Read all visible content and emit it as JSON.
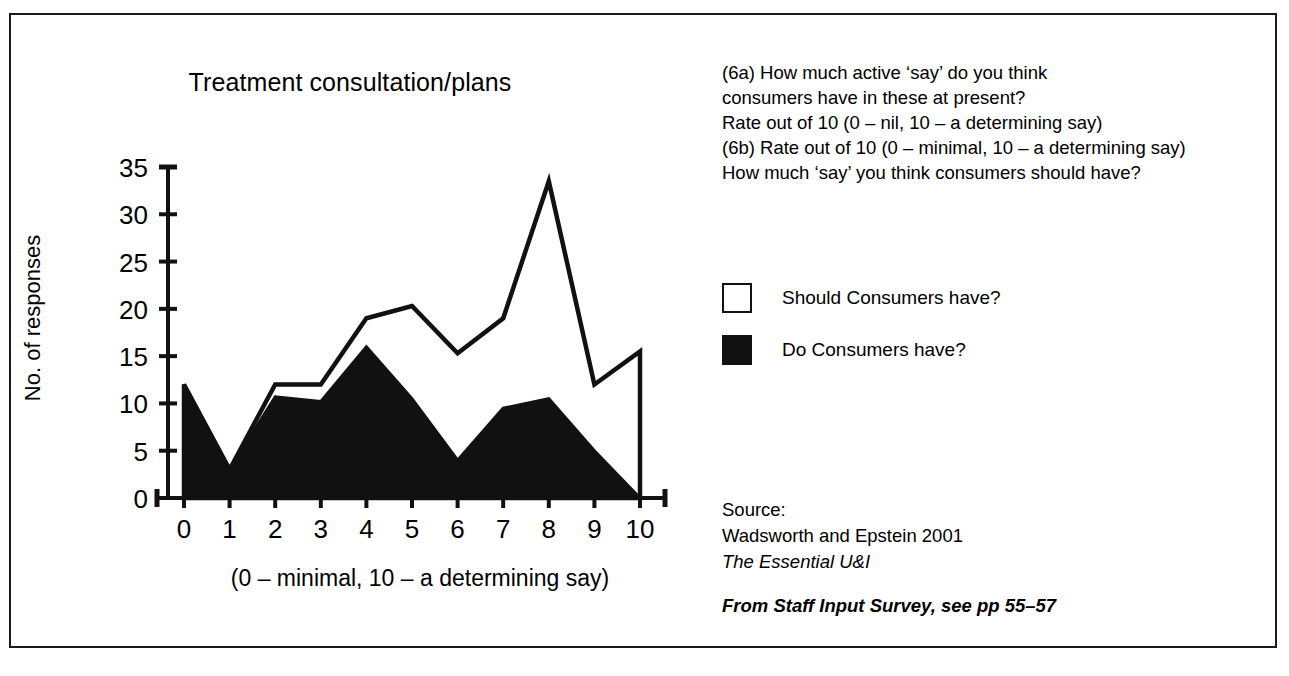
{
  "chart_data": {
    "type": "area",
    "title": "Treatment consultation/plans",
    "xlabel": "(0 – minimal, 10 – a determining say)",
    "ylabel": "No. of responses",
    "categories": [
      "0",
      "1",
      "2",
      "3",
      "4",
      "5",
      "6",
      "7",
      "8",
      "9",
      "10"
    ],
    "x": [
      0,
      1,
      2,
      3,
      4,
      5,
      6,
      7,
      8,
      9,
      10
    ],
    "series": [
      {
        "name": "Should Consumers have?",
        "style": "outlined",
        "color": "#ffffff",
        "stroke": "#111111",
        "values": [
          12,
          3,
          12,
          12,
          19,
          20.3,
          15.3,
          19,
          33.5,
          12,
          15.5
        ]
      },
      {
        "name": "Do Consumers have?",
        "style": "filled",
        "color": "#111111",
        "stroke": "#111111",
        "values": [
          12,
          3,
          10.7,
          10.2,
          16,
          10.5,
          4,
          9.5,
          10.5,
          5,
          0
        ]
      }
    ],
    "ylim": [
      0,
      35
    ],
    "yticks": [
      0,
      5,
      10,
      15,
      20,
      25,
      30,
      35
    ],
    "ytick_labels": [
      "0",
      "5",
      "10",
      "15",
      "20",
      "25",
      "30",
      "35"
    ],
    "xlim": [
      0,
      10
    ],
    "grid": false,
    "legend_position": "right"
  },
  "questions": {
    "lines": [
      "(6a) How much active ‘say’ do you think",
      "consumers have in these at present?",
      "Rate out of 10 (0 – nil, 10 – a determining say)",
      "(6b) Rate out of 10 (0 – minimal, 10 – a determining say)",
      "How much ‘say’ you think consumers should have?"
    ]
  },
  "legend": {
    "items": [
      {
        "label": "Should Consumers have?",
        "swatch": "hollow"
      },
      {
        "label": "Do Consumers have?",
        "swatch": "filled"
      }
    ]
  },
  "source": {
    "heading": "Source:",
    "citation": "Wadsworth and Epstein 2001",
    "work": "The Essential U&I",
    "note": "From Staff Input Survey, see pp 55–57"
  }
}
